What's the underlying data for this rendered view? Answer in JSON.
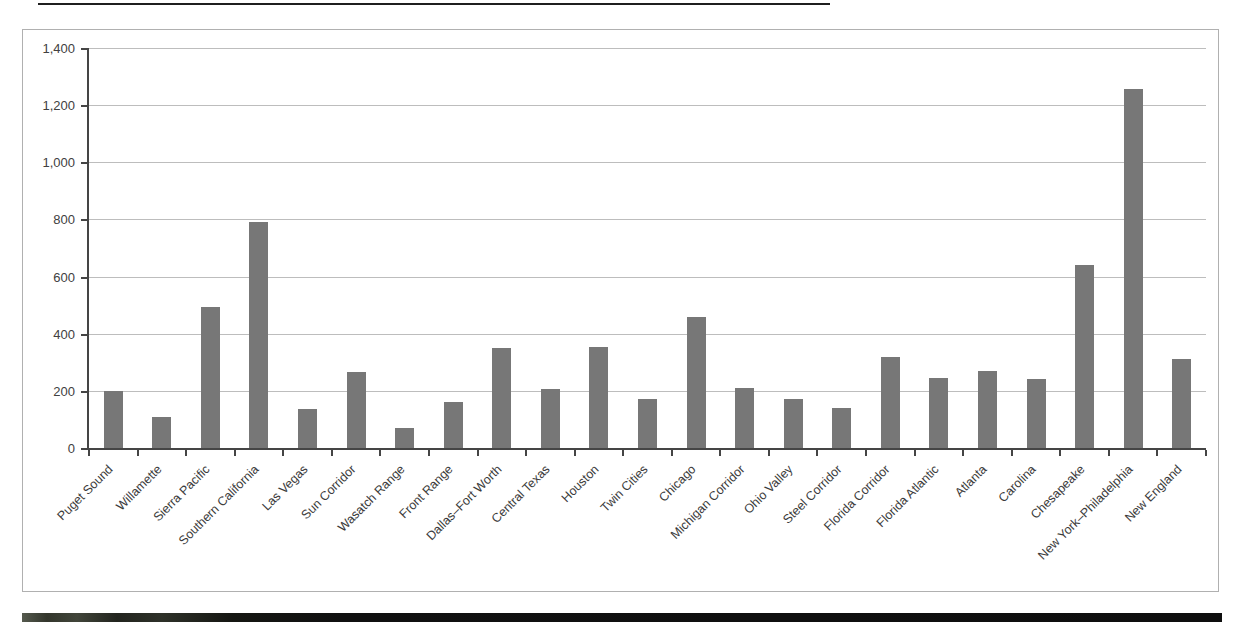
{
  "chart_data": {
    "type": "bar",
    "title": "",
    "xlabel": "",
    "ylabel": "",
    "categories": [
      "Puget Sound",
      "Willamette",
      "Sierra Pacific",
      "Southern California",
      "Las Vegas",
      "Sun Corridor",
      "Wasatch Range",
      "Front Range",
      "Dallas–Fort Worth",
      "Central Texas",
      "Houston",
      "Twin Cities",
      "Chicago",
      "Michigan Corridor",
      "Ohio Valley",
      "Steel Corridor",
      "Florida Corridor",
      "Florida Atlantic",
      "Atlanta",
      "Carolina",
      "Chesapeake",
      "New York–Philadelphia",
      "New England"
    ],
    "values": [
      200,
      110,
      495,
      790,
      135,
      265,
      70,
      160,
      350,
      205,
      355,
      170,
      460,
      210,
      170,
      140,
      320,
      245,
      270,
      240,
      640,
      1255,
      310
    ],
    "ylim": [
      0,
      1400
    ],
    "ytick_interval": 200,
    "ytick_labels": [
      "0",
      "200",
      "400",
      "600",
      "800",
      "1,000",
      "1,200",
      "1,400"
    ],
    "grid": "horizontal",
    "legend": "none",
    "colors": {
      "bar": "#777777",
      "gridline": "#bdbdbd",
      "axis": "#454545",
      "tick_label": "#414141",
      "category_label": "#3b3b3b",
      "frame_border": "#b0b0b0",
      "background": "#ffffff",
      "bottom_band": "#101010"
    }
  }
}
